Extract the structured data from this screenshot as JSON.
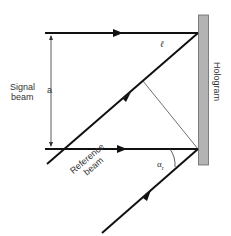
{
  "diagram": {
    "labels": {
      "signal_beam_line1": "Signal",
      "signal_beam_line2": "beam",
      "distance": "a",
      "path_length": "ℓ",
      "hologram": "Hologram",
      "reference_beam_line1": "Reference",
      "reference_beam_line2": "beam",
      "angle": "α",
      "angle_subscript": "r"
    },
    "colors": {
      "beam": "#111111",
      "hologram_fill": "#b3b3b3",
      "hologram_stroke": "#666666"
    }
  }
}
